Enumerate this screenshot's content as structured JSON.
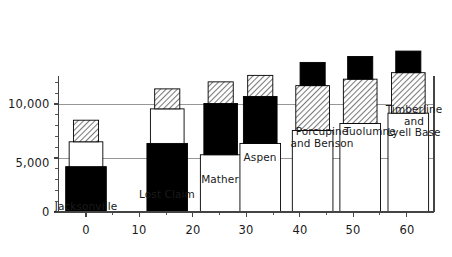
{
  "chart_data": {
    "type": "bar",
    "title": "",
    "subtitle": "",
    "xlabel": "",
    "ylabel": "",
    "xlim": [
      -6,
      66
    ],
    "ylim": [
      0,
      12600
    ],
    "grid": true,
    "legend_position": "none",
    "stacked": true,
    "x_ticks": [
      0,
      10,
      20,
      30,
      40,
      50,
      60
    ],
    "x_tick_labels": [
      "0",
      "10",
      "20",
      "30",
      "40",
      "50",
      "60"
    ],
    "x_minor_ticks": [
      5,
      15,
      25,
      35,
      45,
      55
    ],
    "y_ticks": [
      0,
      5000,
      10000
    ],
    "y_tick_labels": [
      "0",
      "5,000",
      "10,000"
    ],
    "y_minor_ticks": [
      1000,
      2000,
      3000,
      4000,
      6000,
      7000,
      8000,
      9000,
      11000,
      12000
    ],
    "series": [
      {
        "name": "black",
        "fill": "black"
      },
      {
        "name": "white",
        "fill": "white"
      },
      {
        "name": "hatched",
        "fill": "hatched"
      }
    ],
    "categories": [
      "Jacksonville",
      "Lost Claim",
      "Mather",
      "Aspen",
      "Porcupine and Benson",
      "Tuolumne",
      "Timberline and Lyell Base"
    ],
    "bars": [
      {
        "label": "Jacksonville",
        "label_lines": "Jacksonville",
        "x": 0,
        "segments": [
          {
            "fill": "black",
            "from": 0,
            "to": 4200,
            "width_units": 7.6
          },
          {
            "fill": "white",
            "from": 4200,
            "to": 6500,
            "width_units": 6.3
          },
          {
            "fill": "hatched",
            "from": 6500,
            "to": 8500,
            "width_units": 4.7
          }
        ]
      },
      {
        "label": "Lost Claim",
        "label_lines": "Lost Claim",
        "x": 15.2,
        "segments": [
          {
            "fill": "black",
            "from": 0,
            "to": 6350,
            "width_units": 7.6
          },
          {
            "fill": "white",
            "from": 6350,
            "to": 9550,
            "width_units": 6.3
          },
          {
            "fill": "hatched",
            "from": 9550,
            "to": 11400,
            "width_units": 4.7
          }
        ]
      },
      {
        "label": "Mather",
        "label_lines": "Mather",
        "x": 25.2,
        "segments": [
          {
            "fill": "white",
            "from": 0,
            "to": 5300,
            "width_units": 7.6
          },
          {
            "fill": "black",
            "from": 5300,
            "to": 10050,
            "width_units": 6.3
          },
          {
            "fill": "hatched",
            "from": 10050,
            "to": 12050,
            "width_units": 4.7
          }
        ]
      },
      {
        "label": "Aspen",
        "label_lines": "Aspen",
        "x": 32.6,
        "segments": [
          {
            "fill": "white",
            "from": 0,
            "to": 6350,
            "width_units": 7.6
          },
          {
            "fill": "black",
            "from": 6350,
            "to": 10700,
            "width_units": 6.3
          },
          {
            "fill": "hatched",
            "from": 10700,
            "to": 12650,
            "width_units": 4.7
          }
        ]
      },
      {
        "label": "Porcupine and Benson",
        "label_lines": "Porcupine\nand Benson",
        "x": 42.4,
        "segments": [
          {
            "fill": "white",
            "from": 0,
            "to": 7550,
            "width_units": 7.6
          },
          {
            "fill": "hatched",
            "from": 7550,
            "to": 11700,
            "width_units": 6.3
          },
          {
            "fill": "black",
            "from": 11700,
            "to": 13850,
            "width_units": 4.7
          }
        ]
      },
      {
        "label": "Tuolumne",
        "label_lines": "Tuolumne",
        "x": 51.3,
        "segments": [
          {
            "fill": "white",
            "from": 0,
            "to": 8200,
            "width_units": 7.6
          },
          {
            "fill": "hatched",
            "from": 8200,
            "to": 12300,
            "width_units": 6.3
          },
          {
            "fill": "black",
            "from": 12300,
            "to": 14400,
            "width_units": 4.7
          }
        ]
      },
      {
        "label": "Timberline and Lyell Base",
        "label_lines": "Timberline\nand\nLyell Base",
        "x": 60.3,
        "segments": [
          {
            "fill": "white",
            "from": 0,
            "to": 9150,
            "width_units": 7.6
          },
          {
            "fill": "hatched",
            "from": 9150,
            "to": 12900,
            "width_units": 6.3
          },
          {
            "fill": "black",
            "from": 12900,
            "to": 14900,
            "width_units": 4.7
          }
        ]
      }
    ],
    "bar_captions": [
      {
        "text": "Jacksonville",
        "x": 86,
        "y": 201,
        "align": "center"
      },
      {
        "text": "Lost Claim",
        "x": 167,
        "y": 189,
        "align": "center"
      },
      {
        "text": "Mather",
        "x": 220,
        "y": 174,
        "align": "center"
      },
      {
        "text": "Aspen",
        "x": 260,
        "y": 152,
        "align": "center"
      },
      {
        "text": "Porcupine\nand Benson",
        "x": 322,
        "y": 126,
        "align": "center"
      },
      {
        "text": "Tuolumne",
        "x": 370,
        "y": 126,
        "align": "center"
      },
      {
        "text": "Timberline\nand\nLyell Base",
        "x": 414,
        "y": 104,
        "align": "center"
      }
    ],
    "colors": {
      "black_fill": "#000000",
      "white_fill": "#ffffff",
      "hatch_fill": "#d9d9d9",
      "outline": "#000000",
      "axis": "#444444",
      "grid": "#8c8c8c",
      "text": "#1a1a1a",
      "background": "#ffffff"
    }
  },
  "axes": {
    "y_labels": [
      {
        "text": "10,000",
        "y": 104
      },
      {
        "text": "5,000",
        "y": 163
      },
      {
        "text": "0",
        "y": 212
      }
    ],
    "x_labels": [
      {
        "text": "0",
        "x": 86
      },
      {
        "text": "10",
        "x": 139
      },
      {
        "text": "20",
        "x": 193
      },
      {
        "text": "30",
        "x": 246
      },
      {
        "text": "40",
        "x": 300
      },
      {
        "text": "50",
        "x": 353
      },
      {
        "text": "60",
        "x": 407
      }
    ]
  }
}
